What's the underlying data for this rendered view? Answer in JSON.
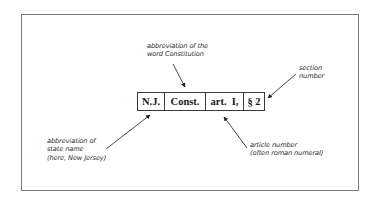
{
  "diagram": {
    "citation": {
      "parts": [
        {
          "id": "state",
          "text": "N.J.",
          "width": 27
        },
        {
          "id": "const",
          "text": "Const.",
          "width": 41
        },
        {
          "id": "article",
          "text": "art.  I,",
          "width": 38
        },
        {
          "id": "section",
          "text": "§ 2",
          "width": 21
        }
      ]
    },
    "annotations": {
      "constitution": {
        "line1": "abbreviation of the",
        "line2": "word Constitution"
      },
      "section": {
        "line1": "section",
        "line2": "number"
      },
      "state": {
        "line1": "abbreviation of",
        "line2": "state name",
        "line3": "(here, New Jersey)"
      },
      "article": {
        "line1": "article number",
        "line2": "(often roman numeral)"
      }
    },
    "colors": {
      "border": "#7a7a7a",
      "text": "#2a2a2a",
      "arrow": "#333333"
    }
  }
}
